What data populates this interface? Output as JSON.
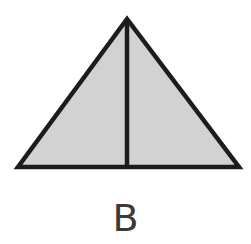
{
  "diagram": {
    "shape": "isosceles-triangle-with-altitude",
    "label": "B",
    "colors": {
      "fill": "#d2d2d2",
      "stroke": "#1c1c1c",
      "label": "#3a3a3a"
    },
    "triangle": {
      "apex": [
        127,
        19
      ],
      "base_left": [
        18,
        167
      ],
      "base_right": [
        239,
        167
      ]
    },
    "altitude": {
      "top": [
        127,
        19
      ],
      "bottom": [
        127,
        167
      ]
    },
    "stroke_width": 4.5
  }
}
